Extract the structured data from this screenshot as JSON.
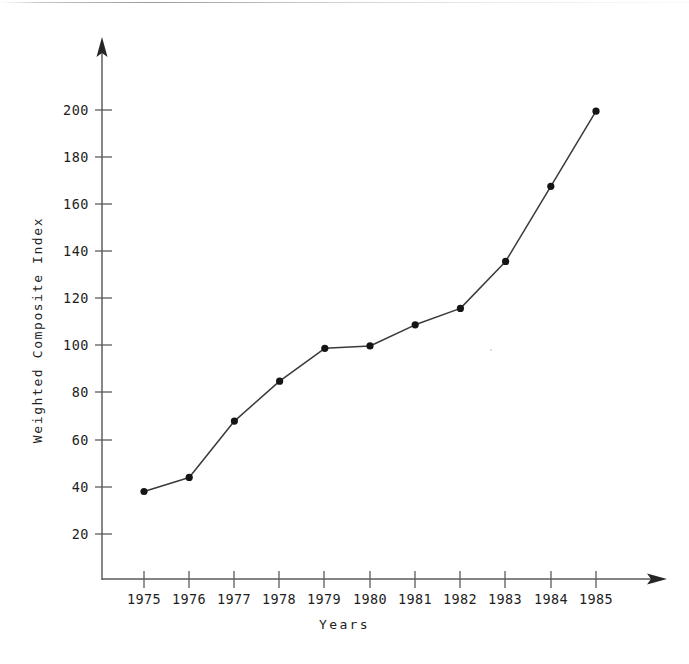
{
  "chart_data": {
    "type": "line",
    "title": "",
    "xlabel": "Years",
    "ylabel": "Weighted Composite Index",
    "categories": [
      "1975",
      "1976",
      "1977",
      "1978",
      "1979",
      "1980",
      "1981",
      "1982",
      "1983",
      "1984",
      "1985"
    ],
    "x": [
      1975,
      1976,
      1977,
      1978,
      1979,
      1980,
      1981,
      1982,
      1983,
      1984,
      1985
    ],
    "values": [
      38,
      44,
      68,
      85,
      99,
      100,
      109,
      116,
      136,
      168,
      200
    ],
    "series": [
      {
        "name": "Weighted Composite Index",
        "values": [
          38,
          44,
          68,
          85,
          99,
          100,
          109,
          116,
          136,
          168,
          200
        ]
      }
    ],
    "ylim": [
      0,
      210
    ],
    "xlim": [
      1974.3,
      1985.9
    ],
    "yticks": [
      20,
      40,
      60,
      80,
      100,
      120,
      140,
      160,
      180,
      200
    ],
    "ytick_labels": [
      "20",
      "40",
      "60",
      "80",
      "100",
      "120",
      "140",
      "160",
      "180",
      "200"
    ],
    "xtick_labels": [
      "1975",
      "1976",
      "1977",
      "1978",
      "1979",
      "1980",
      "1981",
      "1982",
      "1983",
      "1984",
      "1985"
    ],
    "grid": false,
    "legend": "none",
    "marker": "filled-circle",
    "line_color": "#3a3a3a",
    "marker_color": "#151515",
    "axis_color": "#4a4a4a",
    "background_color": "#ffffff",
    "axis_style": "arrow-tipped",
    "annotations": []
  },
  "axes": {
    "y_axis_name": "y-axis",
    "x_axis_name": "x-axis",
    "y_arrow_name": "y-axis-arrowhead",
    "x_arrow_name": "x-axis-arrowhead"
  }
}
